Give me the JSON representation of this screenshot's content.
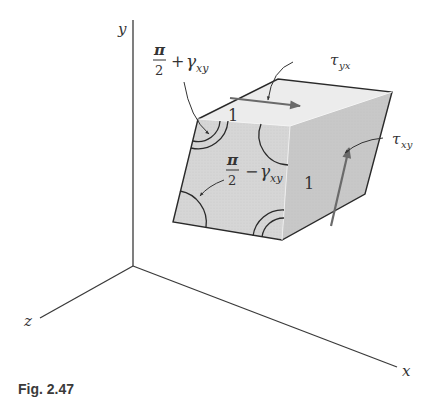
{
  "figure": {
    "caption": "Fig. 2.47",
    "axes": {
      "x_label": "x",
      "y_label": "y",
      "z_label": "z"
    },
    "labels": {
      "angle_plus": {
        "numerator": "π",
        "denominator": "2",
        "op": "+",
        "gamma": "γ",
        "sub": "xy"
      },
      "angle_minus": {
        "numerator": "π",
        "denominator": "2",
        "op": "−",
        "gamma": "γ",
        "sub": "xy"
      },
      "tau_yx": {
        "symbol": "τ",
        "sub": "yx"
      },
      "tau_xy": {
        "symbol": "τ",
        "sub": "xy"
      },
      "top_edge_length": "1",
      "side_edge_length": "1"
    },
    "colors": {
      "front_face": "#d6d6d6",
      "top_face": "#ececec",
      "side_face": "#c9c9c9",
      "edge": "#2a2a2a",
      "arrow": "#6a6a6a",
      "axis": "#3a3a3a"
    }
  }
}
